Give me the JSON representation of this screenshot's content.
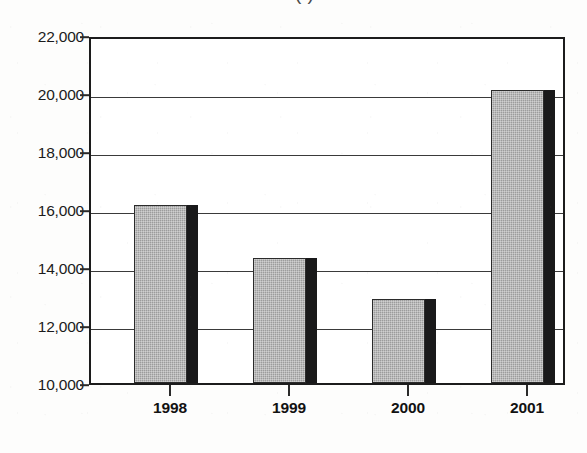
{
  "chart_data": {
    "type": "bar",
    "title": "",
    "title_cropped": "(                    )",
    "xlabel": "",
    "ylabel": "",
    "categories": [
      "1998",
      "1999",
      "2000",
      "2001"
    ],
    "values": [
      16150,
      14300,
      12900,
      20100
    ],
    "series": [
      {
        "name": "",
        "values": [
          16150,
          14300,
          12900,
          20100
        ]
      }
    ],
    "ylim": [
      10000,
      22000
    ],
    "ytick_values": [
      22000,
      20000,
      18000,
      16000,
      14000,
      12000,
      10000
    ],
    "ytick_labels": [
      "22,000",
      "20,000",
      "18,000",
      "16,000",
      "14,000",
      "12,000",
      "10,000"
    ],
    "grid": true,
    "grid_axis": "y",
    "legend": false,
    "legend_position": "none",
    "bar_style": "3d-shadow",
    "colors": {
      "bar_face": "#9c9c9c",
      "bar_shadow": "#19191a",
      "axis": "#1c1c1c",
      "gridline": "#3a3a3a",
      "text": "#121212",
      "background": "#fdfdfc"
    }
  }
}
